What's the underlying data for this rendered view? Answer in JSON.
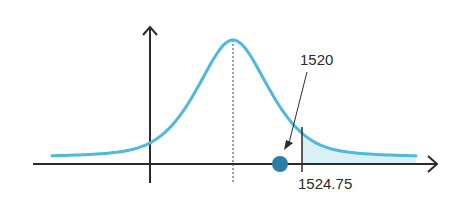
{
  "chart_data": {
    "type": "line",
    "title": "",
    "xlabel": "",
    "ylabel": "",
    "grid": false,
    "curve": "normal-density",
    "mean_marker": "dotted vertical line at peak",
    "sample_value": 1520,
    "critical_value": 1524.75,
    "shaded_region": "right tail beyond critical value",
    "annotations": [
      {
        "text": "1520",
        "points_to": "sample_value"
      },
      {
        "text": "1524.75",
        "marks": "critical_value"
      }
    ],
    "colors": {
      "curve": "#4fb8e0",
      "shade": "#d9f0f7",
      "axes": "#2b2b2b",
      "point": "#2d7ea3"
    }
  }
}
